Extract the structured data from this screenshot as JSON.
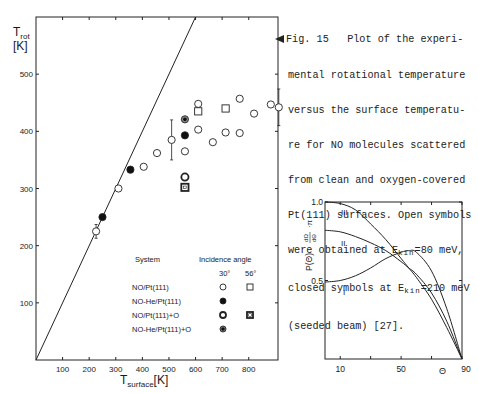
{
  "caption": {
    "lines": [
      "Fig. 15   Plot of the experi-",
      "mental rotational temperature",
      "versus the surface temperatu-",
      "re for NO molecules scattered",
      "from clean and oxygen-covered",
      "Pt(111) surfaces. Open symbols",
      "were obtained at E",
      "closed symbols at E",
      "(seeded beam) [27]."
    ],
    "line7_sub": "kin",
    "line7_tail": "=80 meV,",
    "line8_sub": "kin",
    "line8_tail": "=210 meV"
  },
  "chart_data": [
    {
      "type": "scatter",
      "title": "",
      "xlabel": "T_surface [K]",
      "xlabel_main": "T",
      "xlabel_sub": "surface",
      "xlabel_unit": "[K]",
      "ylabel": "T_rot [K]",
      "ylabel_main": "T",
      "ylabel_sub": "rot",
      "ylabel_unit": "[K]",
      "xlim": [
        0,
        910
      ],
      "ylim": [
        0,
        600
      ],
      "xticks": [
        100,
        200,
        300,
        400,
        500,
        600,
        700,
        800
      ],
      "yticks": [
        100,
        200,
        300,
        400,
        500
      ],
      "grid": false,
      "reference_line": {
        "label": "T_rot = T_surface",
        "x": [
          0,
          600
        ],
        "y": [
          0,
          600
        ]
      },
      "legend": {
        "title_system": "System",
        "title_angle": "Incidence angle",
        "angles": [
          "30°",
          "56°"
        ],
        "entries": [
          {
            "system": "NO/Pt(111)",
            "symbol_30": "open-circle",
            "symbol_56": "open-square"
          },
          {
            "system": "NO-He/Pt(111)",
            "symbol_30": "filled-circle",
            "symbol_56": ""
          },
          {
            "system": "NO/Pt(111)+O",
            "symbol_30": "ring-circle",
            "symbol_56": "ring-square"
          },
          {
            "system": "NO-He/Pt(111)+O",
            "symbol_30": "dot-circle",
            "symbol_56": ""
          }
        ]
      },
      "series": [
        {
          "name": "NO/Pt(111) 30°",
          "symbol": "open-circle",
          "points": [
            [
              226,
              225
            ],
            [
              310,
              300
            ],
            [
              405,
              338
            ],
            [
              455,
              362
            ],
            [
              510,
              385
            ],
            [
              560,
              365
            ],
            [
              610,
              448
            ],
            [
              610,
              403
            ],
            [
              665,
              381
            ],
            [
              713,
              398
            ],
            [
              766,
              457
            ],
            [
              766,
              397
            ],
            [
              820,
              431
            ],
            [
              883,
              447
            ],
            [
              913,
              442
            ]
          ],
          "error_bars": [
            {
              "x": 226,
              "y": 225,
              "err": 12
            },
            {
              "x": 510,
              "y": 385,
              "err": 35
            },
            {
              "x": 913,
              "y": 442,
              "err": 32
            }
          ]
        },
        {
          "name": "NO/Pt(111) 56°",
          "symbol": "open-square",
          "points": [
            [
              610,
              435
            ],
            [
              713,
              440
            ]
          ]
        },
        {
          "name": "NO-He/Pt(111) 30°",
          "symbol": "filled-circle",
          "points": [
            [
              250,
              250
            ],
            [
              355,
              333
            ],
            [
              560,
              393
            ]
          ]
        },
        {
          "name": "NO/Pt(111)+O 30°",
          "symbol": "ring-circle",
          "points": [
            [
              560,
              320
            ]
          ]
        },
        {
          "name": "NO/Pt(111)+O 56°",
          "symbol": "ring-square",
          "points": [
            [
              560,
              302
            ]
          ]
        },
        {
          "name": "NO-He/Pt(111)+O 30°",
          "symbol": "dot-circle",
          "points": [
            [
              560,
              421
            ]
          ]
        }
      ]
    },
    {
      "type": "line",
      "title": "",
      "xlabel": "Θ",
      "ylabel": "P(Θ) dΩ/dΘ · π",
      "ylabel_text": "P(Θ)",
      "ylabel_frac_num": "dΩ",
      "ylabel_frac_den": "dΘ",
      "ylabel_tail": "·π",
      "xlim": [
        0,
        90
      ],
      "ylim": [
        0,
        1.0
      ],
      "xticks": [
        10,
        30,
        50,
        70,
        90
      ],
      "xtick_labels": [
        "10",
        "",
        "50",
        "",
        "90"
      ],
      "yticks": [
        0.5,
        1.0
      ],
      "ytick_labels": [
        "0.5",
        "1.0"
      ],
      "grid": false,
      "x": [
        0,
        10,
        20,
        30,
        40,
        50,
        55,
        60,
        70,
        80,
        90
      ],
      "series": [
        {
          "name": "I",
          "values": [
            0.49,
            0.5,
            0.53,
            0.58,
            0.64,
            0.68,
            0.69,
            0.68,
            0.56,
            0.32,
            0.0
          ]
        },
        {
          "name": "II",
          "values": [
            0.82,
            0.81,
            0.78,
            0.74,
            0.69,
            0.62,
            0.58,
            0.54,
            0.42,
            0.24,
            0.0
          ]
        },
        {
          "name": "III",
          "values": [
            1.0,
            0.99,
            0.95,
            0.86,
            0.76,
            0.64,
            0.58,
            0.52,
            0.38,
            0.2,
            0.0
          ]
        }
      ]
    }
  ]
}
